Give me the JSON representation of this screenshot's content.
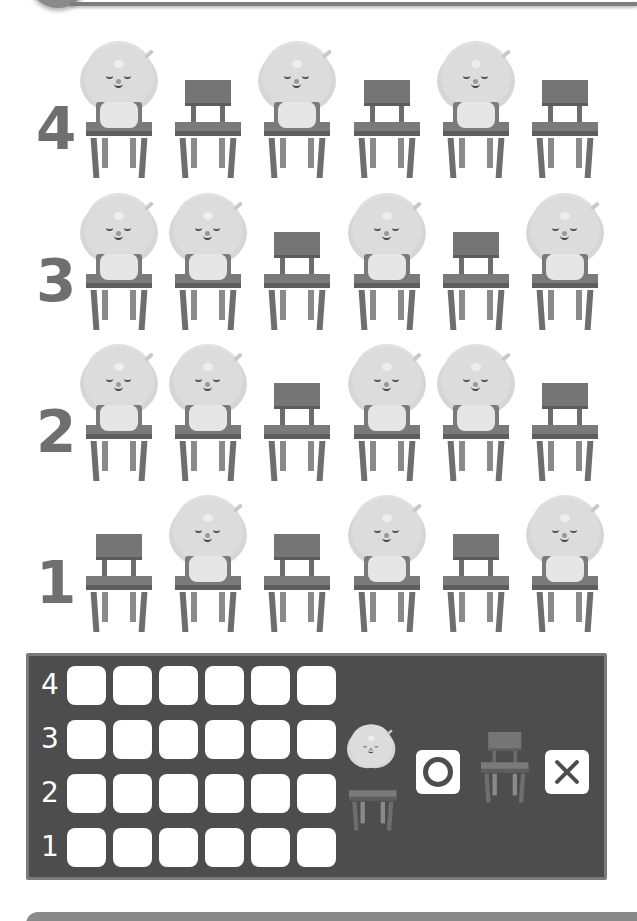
{
  "worksheet": {
    "rows": [
      {
        "number": "4",
        "seats": [
          "sheep",
          "chair",
          "sheep",
          "chair",
          "sheep",
          "chair"
        ]
      },
      {
        "number": "3",
        "seats": [
          "sheep",
          "sheep",
          "chair",
          "sheep",
          "chair",
          "sheep"
        ]
      },
      {
        "number": "2",
        "seats": [
          "sheep",
          "sheep",
          "chair",
          "sheep",
          "sheep",
          "chair"
        ]
      },
      {
        "number": "1",
        "seats": [
          "chair",
          "sheep",
          "chair",
          "sheep",
          "chair",
          "sheep"
        ]
      }
    ]
  },
  "answer_grid": {
    "row_labels": [
      "4",
      "3",
      "2",
      "1"
    ],
    "columns": 6,
    "legend": [
      {
        "icon": "sheep-on-chair-icon",
        "mark": "circle-mark-icon",
        "meaning": "O"
      },
      {
        "icon": "empty-chair-icon",
        "mark": "x-mark-icon",
        "meaning": "X"
      }
    ]
  },
  "colors": {
    "panel_bg": "#4d4d4d",
    "panel_border": "#7a7a7a",
    "number_color": "#6f6f6f",
    "chair": "#757575",
    "wool": "#dcdcdc"
  }
}
